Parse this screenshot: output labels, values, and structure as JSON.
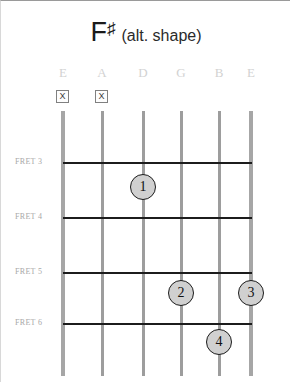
{
  "chord": {
    "root": "F",
    "accidental": "♯",
    "qualifier": "(alt. shape)"
  },
  "strings": [
    {
      "name": "E",
      "x": 62,
      "outer": true,
      "mute": "☒",
      "muted": true
    },
    {
      "name": "A",
      "x": 101,
      "outer": false,
      "mute": "☒",
      "muted": true
    },
    {
      "name": "D",
      "x": 142,
      "outer": false,
      "mute": "",
      "muted": false
    },
    {
      "name": "G",
      "x": 180,
      "outer": false,
      "mute": "",
      "muted": false
    },
    {
      "name": "B",
      "x": 218,
      "outer": false,
      "mute": "",
      "muted": false
    },
    {
      "name": "E",
      "x": 250,
      "outer": true,
      "mute": "",
      "muted": false
    }
  ],
  "frets": [
    {
      "label": "FRET 3",
      "y": 161
    },
    {
      "label": "FRET 4",
      "y": 216
    },
    {
      "label": "FRET 5",
      "y": 271
    },
    {
      "label": "FRET 6",
      "y": 322
    }
  ],
  "fingers": [
    {
      "number": "1",
      "x": 142,
      "y": 186,
      "string": "D",
      "fret": 3
    },
    {
      "number": "2",
      "x": 180,
      "y": 292,
      "string": "G",
      "fret": 5
    },
    {
      "number": "3",
      "x": 250,
      "y": 292,
      "string": "E",
      "fret": 5
    },
    {
      "number": "4",
      "x": 218,
      "y": 341,
      "string": "B",
      "fret": 6
    }
  ],
  "colors": {
    "fret_line": "#1c1c1c",
    "string_line": "#9d9d9d",
    "dot_fill": "#d0d0d0",
    "string_name": "#d2d2d2",
    "fret_label": "#a8a8a8"
  },
  "geometry": {
    "string_top": 110,
    "string_bottom": 375,
    "board_left": 62,
    "board_right": 251
  }
}
